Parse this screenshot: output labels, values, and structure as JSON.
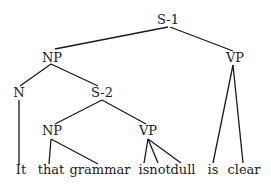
{
  "tree": {
    "nodes": [
      {
        "id": "s1",
        "label": "S-1",
        "x": 168,
        "y": 24
      },
      {
        "id": "np1",
        "label": "NP",
        "x": 52,
        "y": 62
      },
      {
        "id": "vp1",
        "label": "VP",
        "x": 235,
        "y": 62
      },
      {
        "id": "n",
        "label": "N",
        "x": 19,
        "y": 97
      },
      {
        "id": "s2",
        "label": "S-2",
        "x": 102,
        "y": 97
      },
      {
        "id": "np2",
        "label": "NP",
        "x": 52,
        "y": 135
      },
      {
        "id": "vp2",
        "label": "VP",
        "x": 148,
        "y": 135
      }
    ],
    "leaves": [
      {
        "id": "w1",
        "label": "It",
        "x": 21,
        "y": 174
      },
      {
        "id": "w2",
        "label": "that",
        "x": 51,
        "y": 174
      },
      {
        "id": "w3",
        "label": "grammar",
        "x": 100,
        "y": 174
      },
      {
        "id": "w4",
        "label": "is",
        "x": 144,
        "y": 174
      },
      {
        "id": "w5",
        "label": "not",
        "x": 160,
        "y": 174
      },
      {
        "id": "w6",
        "label": "dull",
        "x": 183,
        "y": 174
      },
      {
        "id": "w7",
        "label": "is",
        "x": 213,
        "y": 174
      },
      {
        "id": "w8",
        "label": "clear",
        "x": 244,
        "y": 174
      }
    ],
    "edges": [
      {
        "from": "s1",
        "to": "np1",
        "x1": 168,
        "y1": 27,
        "x2": 55,
        "y2": 49
      },
      {
        "from": "s1",
        "to": "vp1",
        "x1": 170,
        "y1": 27,
        "x2": 233,
        "y2": 51
      },
      {
        "from": "np1",
        "to": "n",
        "x1": 51,
        "y1": 64,
        "x2": 20,
        "y2": 86
      },
      {
        "from": "np1",
        "to": "s2",
        "x1": 51,
        "y1": 64,
        "x2": 98,
        "y2": 86
      },
      {
        "from": "n",
        "to": "w1",
        "x1": 19,
        "y1": 100,
        "x2": 19,
        "y2": 164
      },
      {
        "from": "s2",
        "to": "np2",
        "x1": 102,
        "y1": 100,
        "x2": 55,
        "y2": 124
      },
      {
        "from": "s2",
        "to": "vp2",
        "x1": 102,
        "y1": 100,
        "x2": 146,
        "y2": 124
      },
      {
        "from": "np2",
        "to": "w2",
        "x1": 51,
        "y1": 139,
        "x2": 49,
        "y2": 164
      },
      {
        "from": "np2",
        "to": "w3",
        "x1": 51,
        "y1": 139,
        "x2": 98,
        "y2": 164
      },
      {
        "from": "vp2",
        "to": "w4",
        "x1": 148,
        "y1": 139,
        "x2": 144,
        "y2": 163
      },
      {
        "from": "vp2",
        "to": "w5",
        "x1": 148,
        "y1": 139,
        "x2": 158,
        "y2": 163
      },
      {
        "from": "vp2",
        "to": "w6",
        "x1": 148,
        "y1": 139,
        "x2": 181,
        "y2": 163
      },
      {
        "from": "vp1",
        "to": "w7",
        "x1": 233,
        "y1": 65,
        "x2": 213,
        "y2": 163
      },
      {
        "from": "vp1",
        "to": "w8",
        "x1": 233,
        "y1": 65,
        "x2": 243,
        "y2": 163
      }
    ]
  }
}
